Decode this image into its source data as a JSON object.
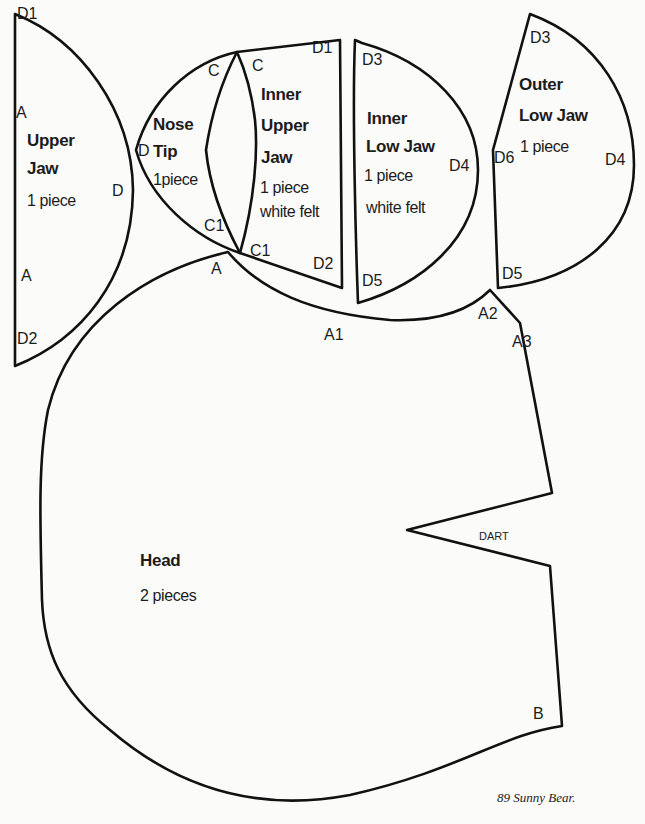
{
  "caption": "89  Sunny Bear.",
  "pieces": {
    "upper_jaw": {
      "title_line1": "Upper",
      "title_line2": "Jaw",
      "count": "1 piece",
      "points": {
        "d1": "D1",
        "a_top": "A",
        "d": "D",
        "a_bottom": "A",
        "d2": "D2"
      }
    },
    "nose_tip": {
      "title_line1": "Nose",
      "title_line2": "Tip",
      "count": "1piece",
      "points": {
        "c": "C",
        "d": "D",
        "c1": "C1"
      }
    },
    "inner_upper_jaw": {
      "title_line1": "Inner",
      "title_line2": "Upper",
      "title_line3": "Jaw",
      "count": "1 piece",
      "material": "white felt",
      "points": {
        "c": "C",
        "d1": "D1",
        "c1": "C1",
        "d2": "D2"
      }
    },
    "inner_low_jaw": {
      "title_line1": "Inner",
      "title_line2": "Low Jaw",
      "count": "1 piece",
      "material": "white felt",
      "points": {
        "d3": "D3",
        "d4": "D4",
        "d5": "D5"
      }
    },
    "outer_low_jaw": {
      "title_line1": "Outer",
      "title_line2": "Low Jaw",
      "count": "1 piece",
      "points": {
        "d3": "D3",
        "d6": "D6",
        "d4": "D4",
        "d5": "D5"
      }
    },
    "head": {
      "title": "Head",
      "count": "2 pieces",
      "dart": "DART",
      "points": {
        "a": "A",
        "a1": "A1",
        "a2": "A2",
        "a3": "A3",
        "b": "B"
      }
    }
  },
  "colors": {
    "line": "#111111",
    "paper": "#fbfbfa"
  }
}
